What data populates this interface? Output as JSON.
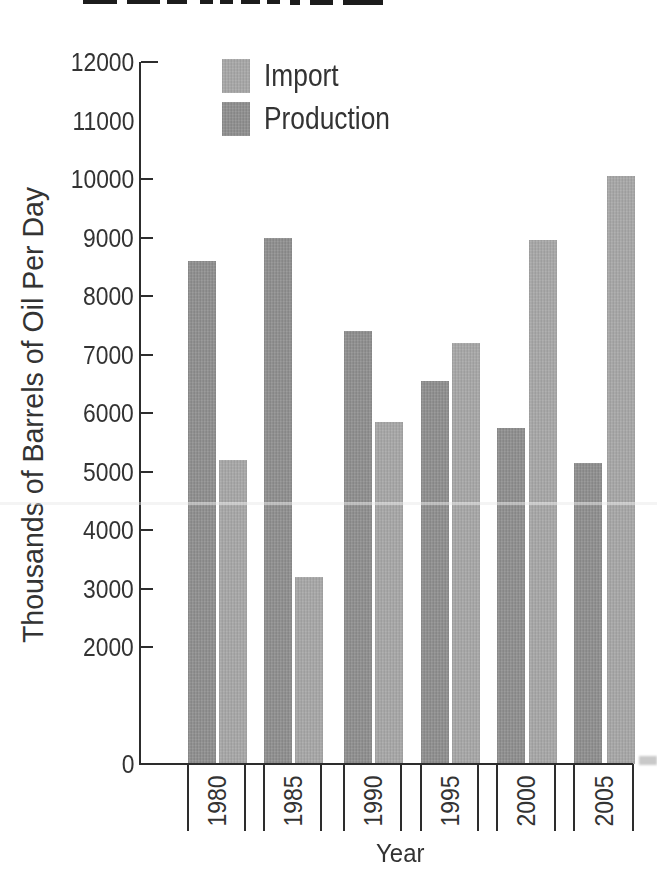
{
  "chart_data": {
    "type": "bar",
    "categories": [
      "1980",
      "1985",
      "1990",
      "1995",
      "2000",
      "2005"
    ],
    "series": [
      {
        "name": "Production",
        "color": "#8d8d8d",
        "values": [
          8600,
          9000,
          7400,
          6550,
          5750,
          5150
        ]
      },
      {
        "name": "Import",
        "color": "#a5a5a5",
        "values": [
          5200,
          3200,
          5850,
          7200,
          8950,
          10050
        ]
      }
    ],
    "xlabel": "Year",
    "ylabel": "Thousands of Barrels of Oil Per Day",
    "ylim": [
      0,
      12000
    ],
    "yticks": [
      {
        "label": "12000",
        "value": 12000,
        "tick": true
      },
      {
        "label": "11000",
        "value": 11000,
        "tick": false
      },
      {
        "label": "10000",
        "value": 10000,
        "tick": true
      },
      {
        "label": "9000",
        "value": 9000,
        "tick": true
      },
      {
        "label": "8000",
        "value": 8000,
        "tick": true
      },
      {
        "label": "7000",
        "value": 7000,
        "tick": true
      },
      {
        "label": "6000",
        "value": 6000,
        "tick": true
      },
      {
        "label": "5000",
        "value": 5000,
        "tick": true
      },
      {
        "label": "4000",
        "value": 4000,
        "tick": true
      },
      {
        "label": "3000",
        "value": 3000,
        "tick": true
      },
      {
        "label": "2000",
        "value": 2000,
        "tick": true
      },
      {
        "label": "0",
        "value": 0,
        "tick": true
      }
    ],
    "legend": {
      "position": "top-left-inside",
      "entries": [
        {
          "label": "Import",
          "color": "#a5a5a5"
        },
        {
          "label": "Production",
          "color": "#8d8d8d"
        }
      ]
    },
    "grid": false
  }
}
